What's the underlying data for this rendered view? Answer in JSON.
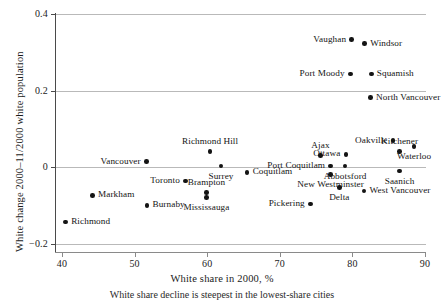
{
  "chart_data": {
    "type": "scatter",
    "title": "",
    "xlabel": "White share in 2000, %",
    "ylabel": "White change 2000–11/2000 white population",
    "xlim": [
      38.5,
      91.5
    ],
    "ylim": [
      -0.225,
      0.42
    ],
    "xticks": [
      40,
      50,
      60,
      70,
      80,
      90
    ],
    "xtick_labels": [
      "40",
      "50",
      "60",
      "70",
      "80",
      "90"
    ],
    "yticks": [
      -0.2,
      0,
      0.2,
      0.4
    ],
    "ytick_labels": [
      "−0.2",
      "0",
      "0.2",
      "0.4"
    ],
    "grid": "horizontal",
    "legend": "none",
    "point_color": "#141414",
    "grid_color": "#b9b9b9",
    "points": [
      {
        "label": "Vaughan",
        "x": 79.9,
        "y": 0.333,
        "label_pos": "left"
      },
      {
        "label": "Windsor",
        "x": 81.7,
        "y": 0.323,
        "label_pos": "right"
      },
      {
        "label": "Port Moody",
        "x": 79.7,
        "y": 0.244,
        "label_pos": "left"
      },
      {
        "label": "Squamish",
        "x": 82.6,
        "y": 0.244,
        "label_pos": "right"
      },
      {
        "label": "North Vancouver",
        "x": 82.5,
        "y": 0.182,
        "label_pos": "right"
      },
      {
        "label": "Oakville",
        "x": 85.6,
        "y": 0.07,
        "label_pos": "left"
      },
      {
        "label": "Kitchener",
        "x": 86.5,
        "y": 0.042,
        "label_pos": "above"
      },
      {
        "label": "Waterloo",
        "x": 88.5,
        "y": 0.055,
        "label_pos": "below"
      },
      {
        "label": "Richmond Hill",
        "x": 60.4,
        "y": 0.041,
        "label_pos": "above"
      },
      {
        "label": "Ajax",
        "x": 75.6,
        "y": 0.031,
        "label_pos": "above"
      },
      {
        "label": "Ottawa",
        "x": 79.1,
        "y": 0.034,
        "label_pos": "left"
      },
      {
        "label": "Abbotsford",
        "x": 79.0,
        "y": 0.003,
        "label_pos": "below"
      },
      {
        "label": "Vancouver",
        "x": 51.6,
        "y": 0.015,
        "label_pos": "left"
      },
      {
        "label": "Saanich",
        "x": 86.5,
        "y": -0.01,
        "label_pos": "below"
      },
      {
        "label": "Port Coquitlam",
        "x": 77.0,
        "y": 0.003,
        "label_pos": "left"
      },
      {
        "label": "Surrey",
        "x": 61.9,
        "y": 0.003,
        "label_pos": "below"
      },
      {
        "label": "Coquitlam",
        "x": 65.5,
        "y": -0.013,
        "label_pos": "right"
      },
      {
        "label": "Toronto",
        "x": 57.0,
        "y": -0.036,
        "label_pos": "left"
      },
      {
        "label": "New Westminster",
        "x": 77.0,
        "y": -0.018,
        "label_pos": "below"
      },
      {
        "label": "Brampton",
        "x": 59.9,
        "y": -0.065,
        "label_pos": "above"
      },
      {
        "label": "Delta",
        "x": 78.2,
        "y": -0.052,
        "label_pos": "below"
      },
      {
        "label": "West Vancouver",
        "x": 81.6,
        "y": -0.062,
        "label_pos": "right"
      },
      {
        "label": "Markham",
        "x": 44.2,
        "y": -0.073,
        "label_pos": "right"
      },
      {
        "label": "Mississauga",
        "x": 59.9,
        "y": -0.078,
        "label_pos": "below"
      },
      {
        "label": "Burnaby",
        "x": 51.7,
        "y": -0.099,
        "label_pos": "right"
      },
      {
        "label": "Pickering",
        "x": 74.2,
        "y": -0.096,
        "label_pos": "left"
      },
      {
        "label": "Richmond",
        "x": 40.5,
        "y": -0.143,
        "label_pos": "right"
      }
    ]
  },
  "caption": "White share decline is steepest in the lowest-share cities"
}
